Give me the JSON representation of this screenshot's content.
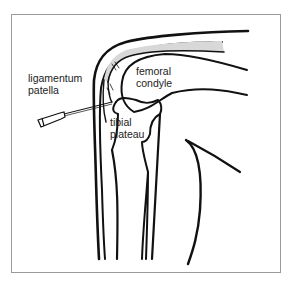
{
  "figure": {
    "labels": {
      "ligamentum_line1": "ligamentum",
      "ligamentum_line2": "patella",
      "femoral_line1": "femoral",
      "femoral_line2": "condyle",
      "tibial_line1": "tibial",
      "tibial_line2": "plateau"
    },
    "colors": {
      "stroke": "#111111",
      "cartilage_fill": "#d8d8d8",
      "frame": "#9a9a9a",
      "background": "#ffffff"
    }
  }
}
